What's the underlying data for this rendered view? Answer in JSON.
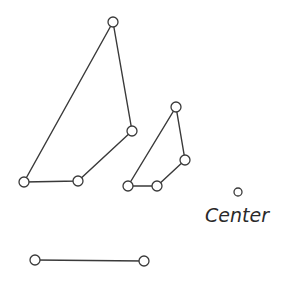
{
  "diagram": {
    "shapes": [
      {
        "name": "polyline-large",
        "nodes": [
          [
            24,
            182
          ],
          [
            78,
            181
          ],
          [
            132,
            131
          ],
          [
            113,
            22
          ]
        ],
        "closed": true
      },
      {
        "name": "polyline-small",
        "nodes": [
          [
            128,
            186
          ],
          [
            157,
            186
          ],
          [
            185,
            160
          ],
          [
            176,
            107
          ]
        ],
        "closed": true
      },
      {
        "name": "segment",
        "nodes": [
          [
            35,
            260
          ],
          [
            144,
            261
          ]
        ],
        "closed": false
      }
    ],
    "center": {
      "point": [
        238,
        192
      ],
      "label": "Center"
    },
    "node_radius": 5
  }
}
